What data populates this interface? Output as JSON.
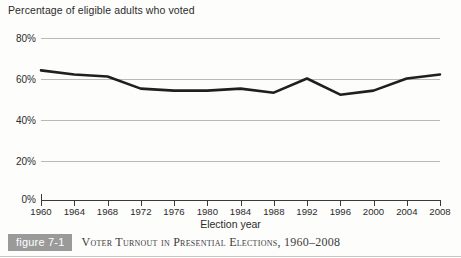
{
  "figure": {
    "badge_label": "figure 7-1",
    "caption": "Voter Turnout in Presential Elections, 1960–2008"
  },
  "axis_title_top": "Percentage of eligible adults who voted",
  "colors": {
    "line": "#1f1f1f",
    "gridline": "#b9b9b9",
    "axis": "#3a3a3a",
    "badge_bg": "#9a9a9a",
    "text": "#2b2b2b",
    "background": "#fdfdfc"
  },
  "chart_data": {
    "type": "line",
    "title": "Voter Turnout in Presential Elections, 1960–2008",
    "subtitle": "",
    "xlabel": "Election year",
    "ylabel": "Percentage of eligible adults who voted",
    "x": [
      1960,
      1964,
      1968,
      1972,
      1976,
      1980,
      1984,
      1988,
      1992,
      1996,
      2000,
      2004,
      2008
    ],
    "categories": [
      "1960",
      "1964",
      "1968",
      "1972",
      "1976",
      "1980",
      "1984",
      "1988",
      "1992",
      "1996",
      "2000",
      "2004",
      "2008"
    ],
    "values": [
      64,
      62,
      61,
      55,
      54,
      54,
      55,
      53,
      60,
      52,
      54,
      60,
      62
    ],
    "ylim": [
      0,
      80
    ],
    "xlim": [
      1960,
      2008
    ],
    "ytick_labels": [
      "0%",
      "20%",
      "40%",
      "60%",
      "80%"
    ],
    "yticks": [
      0,
      20,
      40,
      60,
      80
    ],
    "grid": true,
    "legend": "none",
    "legend_position": "none",
    "series": [
      {
        "name": "Voter turnout",
        "values": [
          64,
          62,
          61,
          55,
          54,
          54,
          55,
          53,
          60,
          52,
          54,
          60,
          62
        ]
      }
    ]
  }
}
